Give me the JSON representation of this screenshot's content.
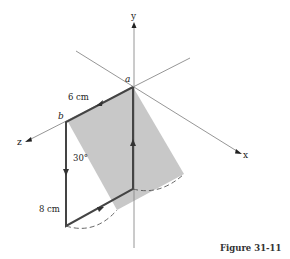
{
  "figure": {
    "caption": "Figure 31-11",
    "axes": {
      "x_label": "x",
      "y_label": "y",
      "z_label": "z"
    },
    "points": {
      "a_label": "a",
      "b_label": "b"
    },
    "dimensions": {
      "top_edge": "6 cm",
      "left_edge": "8 cm",
      "angle": "30°"
    }
  },
  "colors": {
    "shading": "#c8c8c8",
    "axis": "#888888",
    "loop": "#444444"
  }
}
